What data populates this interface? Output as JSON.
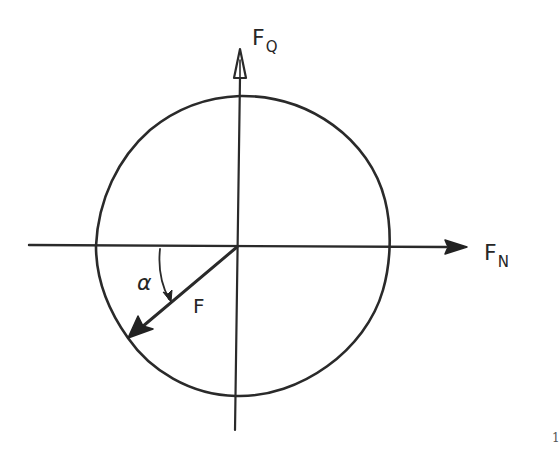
{
  "diagram": {
    "axes": {
      "vertical": {
        "label_main": "F",
        "label_sub": "Q",
        "name": "transverse force axis"
      },
      "horizontal": {
        "label_main": "F",
        "label_sub": "N",
        "name": "normal force axis"
      }
    },
    "vector": {
      "label": "F",
      "name": "resultant force vector"
    },
    "angle": {
      "label": "α",
      "name": "angle between force and normal axis"
    },
    "curve": {
      "name": "closed envelope curve"
    }
  },
  "page": {
    "number": "1"
  },
  "colors": {
    "ink": "#2a2a2a",
    "background": "#ffffff"
  }
}
